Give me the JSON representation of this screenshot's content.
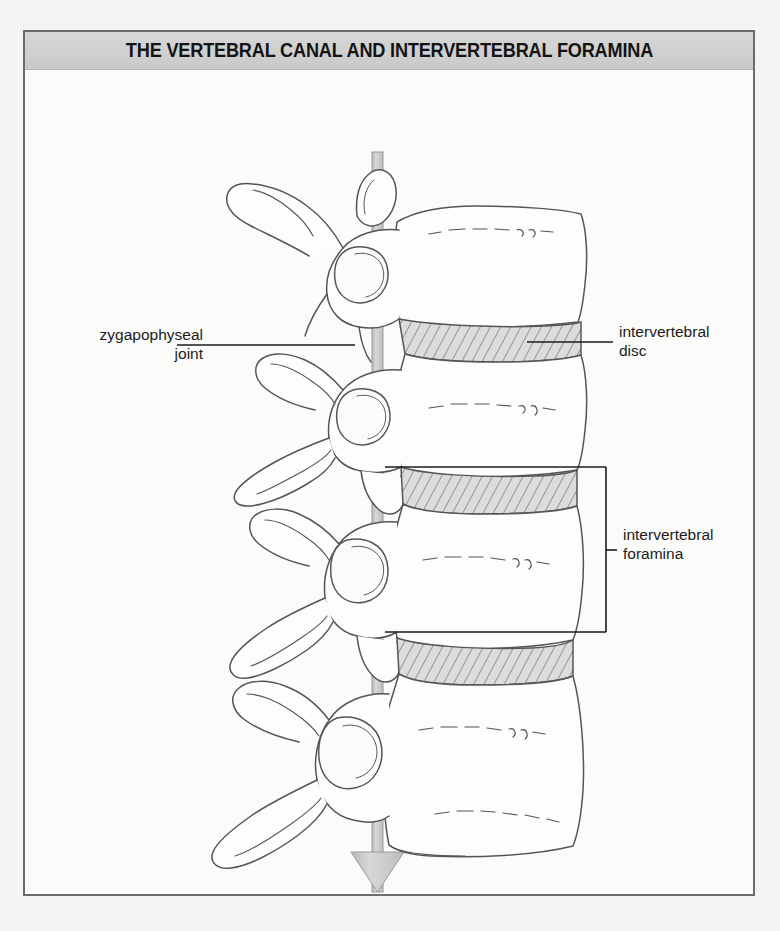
{
  "figure": {
    "title": "THE VERTEBRAL CANAL AND INTERVERTEBRAL FORAMINA",
    "background_color": "#fbfbfa",
    "frame_color": "#6b6b6b",
    "title_bar_color": "#d0d0d0",
    "ink_color": "#4a4a4a",
    "arrow_color": "#c9c9c9",
    "labels": [
      {
        "id": "zygapophyseal-joint",
        "lines": [
          "zygapophyseal",
          "joint"
        ],
        "text": "zygapophyseal joint",
        "align": "right",
        "side": "left",
        "leader": "straight-line"
      },
      {
        "id": "intervertebral-disc",
        "lines": [
          "intervertebral",
          "disc"
        ],
        "text": "intervertebral disc",
        "align": "left",
        "side": "right",
        "leader": "straight-line"
      },
      {
        "id": "intervertebral-foramina",
        "lines": [
          "intervertebral",
          "foramina"
        ],
        "text": "intervertebral foramina",
        "align": "left",
        "side": "right",
        "leader": "bracket"
      },
      {
        "id": "vertebral-canal",
        "lines": [
          "vertebral canal"
        ],
        "text": "vertebral canal",
        "align": "center",
        "side": "bottom",
        "leader": "arrow-down"
      }
    ],
    "annotations": {
      "disc_count": 3,
      "vertebra_count": 4,
      "disc_fill": "hatched",
      "arrow_direction": "down"
    }
  }
}
